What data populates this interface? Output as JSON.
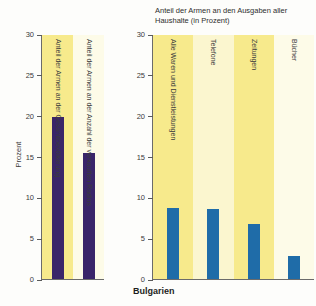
{
  "caption": "Bulgarien",
  "colors": {
    "bar_left": "#3a2569",
    "bar_right": "#1f6ca8",
    "band_strong": "#f7ea8c",
    "band_weak": "#fbf6cf",
    "band_pale": "#fdfbe8",
    "axis": "#6b6b6b",
    "text": "#2e2e2e"
  },
  "left_panel": {
    "axis_title": "Prozent",
    "y_ticks": [
      "0",
      "5",
      "10",
      "15",
      "20",
      "25",
      "30"
    ]
  },
  "right_panel": {
    "headline": "Anteil der Armen an den Ausgaben aller\nHaushalte (in Prozent)",
    "y_ticks": [
      "0",
      "5",
      "10",
      "15",
      "20",
      "25",
      "30"
    ]
  },
  "chart_data": [
    {
      "type": "bar",
      "title": "",
      "xlabel": "",
      "ylabel": "Prozent",
      "ylim": [
        0,
        30
      ],
      "yticks": [
        0,
        5,
        10,
        15,
        20,
        25,
        30
      ],
      "grid": false,
      "legend": "none",
      "bar_color": "#3a2569",
      "categories": [
        "Anteil der Armen an der Gesamtbevölkerung",
        "Anteil der Armen an der Anzahl der verkauften Radios"
      ],
      "values": [
        19.9,
        15.5
      ],
      "band_colors": [
        "#f7ea8c",
        "#fdfbe8"
      ]
    },
    {
      "type": "bar",
      "title": "Anteil der Armen an den Ausgaben aller Haushalte (in Prozent)",
      "xlabel": "",
      "ylabel": "",
      "ylim": [
        0,
        30
      ],
      "yticks": [
        0,
        5,
        10,
        15,
        20,
        25,
        30
      ],
      "grid": false,
      "legend": "none",
      "bar_color": "#1f6ca8",
      "categories": [
        "Alle Waren und Dienstleistungen",
        "Telefone",
        "Zeitungen",
        "Bücher"
      ],
      "values": [
        8.8,
        8.7,
        6.8,
        2.9
      ],
      "band_colors": [
        "#f7ea8c",
        "#fbf6cf",
        "#f7ea8c",
        "#fdfbe8"
      ]
    }
  ]
}
